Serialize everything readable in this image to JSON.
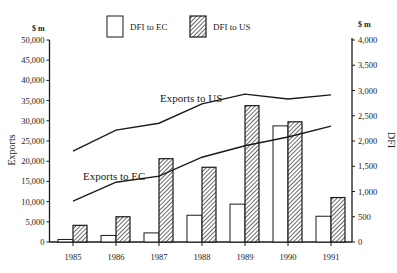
{
  "chart_data": {
    "type": "bar+line",
    "title": "",
    "categories": [
      "1985",
      "1986",
      "1987",
      "1988",
      "1989",
      "1990",
      "1991"
    ],
    "left_axis": {
      "label": "Exports",
      "unit": "$ m",
      "range": [
        0,
        50000
      ],
      "ticks": [
        0,
        5000,
        10000,
        15000,
        20000,
        25000,
        30000,
        35000,
        40000,
        45000,
        50000
      ],
      "tick_labels": [
        "0",
        "5,000",
        "10,000",
        "15,000",
        "20,000",
        "25,000",
        "30,000",
        "35,000",
        "40,000",
        "45,000",
        "50,000"
      ]
    },
    "right_axis": {
      "label": "DFI",
      "unit": "$ m",
      "range": [
        0,
        4000
      ],
      "ticks": [
        0,
        500,
        1000,
        1500,
        2000,
        2500,
        3000,
        3500,
        4000
      ],
      "tick_labels": [
        "0",
        "500",
        "1,000",
        "1,500",
        "2,000",
        "2,500",
        "3,000",
        "3,500",
        "4,000"
      ]
    },
    "series": [
      {
        "name": "DFI to EC",
        "type": "bar",
        "axis": "right",
        "style": "open",
        "values": [
          50,
          130,
          180,
          530,
          750,
          2300,
          510
        ]
      },
      {
        "name": "DFI to US",
        "type": "bar",
        "axis": "right",
        "style": "hatched",
        "values": [
          330,
          500,
          1650,
          1480,
          2700,
          2380,
          880
        ]
      },
      {
        "name": "Exports to US",
        "type": "line",
        "axis": "left",
        "values": [
          22500,
          27700,
          29400,
          34200,
          36600,
          35400,
          36400
        ]
      },
      {
        "name": "Exports to EC",
        "type": "line",
        "axis": "left",
        "values": [
          10100,
          14800,
          16300,
          21000,
          23800,
          26000,
          28700
        ]
      }
    ],
    "legend": [
      {
        "label": "DFI to EC",
        "style": "open"
      },
      {
        "label": "DFI to US",
        "style": "hatched"
      }
    ],
    "annotations": [
      {
        "text": "Exports to US"
      },
      {
        "text": "Exports to EC"
      }
    ],
    "grid": false,
    "legend_position": "top"
  }
}
